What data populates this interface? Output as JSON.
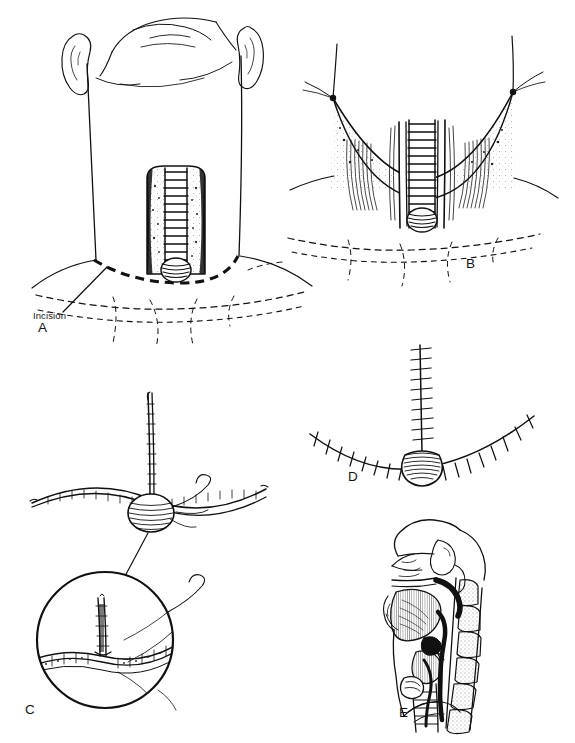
{
  "figure": {
    "style": "black-and-white pen-and-ink line drawing",
    "background_color": "#ffffff",
    "ink_color": "#111111",
    "width": 575,
    "height": 743,
    "panel_count": 5
  },
  "labels": {
    "panel_a": "A",
    "panel_b": "B",
    "panel_c": "C",
    "panel_d": "D",
    "panel_e": "E",
    "incision": "Incision"
  },
  "panels": [
    {
      "letter": "A",
      "name": "anterior-neck-view",
      "caption_terms": [
        "Incision"
      ],
      "description": "Frontal view of a patient's lower face, neck and upper chest with ears visible; an exposed vertical tracheal segment with cartilage rings sits in the midline of the lower neck above a round stoma. A heavy dashed curved line across the base of the neck marks the planned skin incision, with a leader line running to the label 'Incision'. Lighter dashed lines indicate clavicles and sternal notch landmarks."
    },
    {
      "letter": "B",
      "name": "retracted-skin-flap-view",
      "caption_terms": [],
      "description": "Superiorly retracted apron skin flap held up by two traction sutures at its lateral corners, exposing strap muscles on each side and the midline trachea with its ladder of cartilage rings; the rounded stoma opening sits at the inferior end. Dashed lines below show clavicles and sternal notch."
    },
    {
      "letter": "C",
      "name": "t-closure-suturing-view",
      "caption_terms": [],
      "description": "Schematic of the T-shaped wound closure: a long vertical limb meeting a gently curved horizontal limb at a central round stoma, with a curved surgical needle and trailing suture thread. A leader line connects the junction to a large circular magnified inset below-left showing the detailed T-junction closure with running sutures and the needle passing through tissue layers."
    },
    {
      "letter": "D",
      "name": "completed-closure-view",
      "caption_terms": [],
      "description": "Completed T-shaped closure shown with interrupted cross-stitch sutures along both the vertical limb and the curved horizontal limb, meeting at the circular stoma which is drawn with dense hatching."
    },
    {
      "letter": "E",
      "name": "sagittal-section-view",
      "caption_terms": [],
      "description": "Mid-sagittal cross-section of the head and neck showing nasal cavity, hard and soft palate, tongue, oral cavity, mandible, epiglottis, pharynx, larynx, trachea and the stacked cervical vertebrae with stippled shading; the airway is shaded dark and the tracheostoma/tube position is indicated at the anterior tracheal wall."
    }
  ]
}
